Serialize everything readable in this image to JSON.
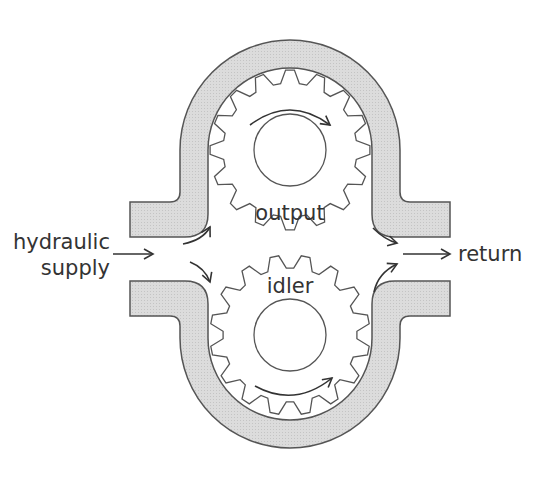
{
  "diagram": {
    "type": "gear-pump-cross-section",
    "labels": {
      "input_line1": "hydraulic",
      "input_line2": "supply",
      "output_port": "return",
      "upper_gear": "output",
      "lower_gear": "idler"
    },
    "colors": {
      "housing_fill": "#d9d9d9",
      "stroke": "#555555",
      "arrow": "#333333",
      "background": "#ffffff"
    },
    "gears": [
      {
        "name": "output",
        "cx": 290,
        "cy": 150,
        "teeth": 16
      },
      {
        "name": "idler",
        "cx": 290,
        "cy": 335,
        "teeth": 16
      }
    ]
  }
}
